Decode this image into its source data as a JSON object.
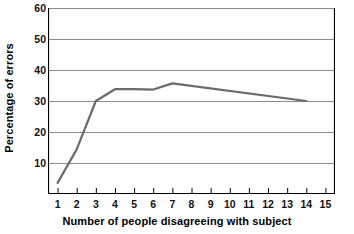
{
  "chart_data": {
    "type": "line",
    "title": "",
    "xlabel": "Number of people disagreeing with subject",
    "ylabel": "Percentage of errors",
    "xlim": [
      0.5,
      15.5
    ],
    "ylim": [
      0,
      60
    ],
    "xticks": [
      "1",
      "2",
      "3",
      "4",
      "5",
      "6",
      "7",
      "8",
      "9",
      "10",
      "11",
      "12",
      "13",
      "14",
      "15"
    ],
    "yticks": [
      "10",
      "20",
      "30",
      "40",
      "50",
      "60"
    ],
    "grid": "horizontal",
    "legend": "none",
    "x": [
      1,
      2,
      3,
      4,
      5,
      6,
      7,
      14
    ],
    "values": [
      3.6,
      14.4,
      30.0,
      33.8,
      33.8,
      33.7,
      35.7,
      30.0
    ],
    "series": [
      {
        "name": "Percentage of errors",
        "color": "#6b6b6b",
        "points": [
          {
            "x": 1,
            "y": 3.6
          },
          {
            "x": 2,
            "y": 14.4
          },
          {
            "x": 3,
            "y": 30.0
          },
          {
            "x": 4,
            "y": 33.8
          },
          {
            "x": 5,
            "y": 33.8
          },
          {
            "x": 6,
            "y": 33.7
          },
          {
            "x": 7,
            "y": 35.7
          },
          {
            "x": 14,
            "y": 30.0
          }
        ]
      }
    ],
    "colors": {
      "line": "#6b6b6b",
      "grid": "#8c8c8c",
      "axis": "#000000",
      "text": "#000000",
      "background": "#ffffff"
    }
  }
}
